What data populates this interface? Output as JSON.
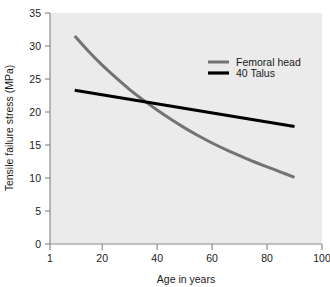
{
  "chart_data": {
    "type": "line",
    "title": "",
    "xlabel": "Age in years",
    "ylabel": "Tensile failure stress (MPa)",
    "xlim": [
      1,
      100
    ],
    "ylim": [
      0,
      35
    ],
    "xticks": [
      1,
      20,
      40,
      60,
      80,
      100
    ],
    "yticks": [
      0,
      5,
      10,
      15,
      20,
      25,
      30,
      35
    ],
    "xtick_labels": [
      "1",
      "20",
      "40",
      "60",
      "80",
      "100"
    ],
    "ytick_labels": [
      "0",
      "5",
      "10",
      "15",
      "20",
      "25",
      "30",
      "35"
    ],
    "grid": false,
    "plot_background": "#ebebeb",
    "legend_position": "upper right",
    "series": [
      {
        "name": "Femoral head",
        "color": "#737373",
        "style": "curve",
        "x": [
          10,
          15,
          20,
          25,
          30,
          35,
          40,
          45,
          50,
          55,
          60,
          65,
          70,
          75,
          80,
          85,
          90
        ],
        "values": [
          31.5,
          29.2,
          27.1,
          25.2,
          23.4,
          21.8,
          20.3,
          18.9,
          17.6,
          16.4,
          15.3,
          14.3,
          13.4,
          12.5,
          11.7,
          10.9,
          10.1
        ]
      },
      {
        "name": "40 Talus",
        "color": "#000000",
        "style": "straight",
        "x": [
          10,
          90
        ],
        "values": [
          23.3,
          17.8
        ]
      }
    ],
    "annotations": [
      {
        "label": "curve-intersection",
        "x": 38,
        "y": 21.4
      }
    ]
  },
  "legend": {
    "items": [
      {
        "label": "Femoral head",
        "color": "#737373",
        "thickness": 3
      },
      {
        "label": "40 Talus",
        "color": "#000000",
        "thickness": 3.2
      }
    ]
  },
  "axes": {
    "x_title": "Age in years",
    "y_title": "Tensile failure stress (MPa)"
  }
}
